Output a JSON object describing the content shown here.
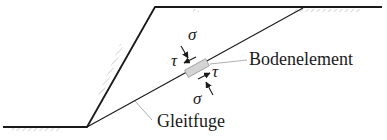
{
  "diagram": {
    "type": "slope-failure-sketch",
    "labels": {
      "element": "Bodenelement",
      "slip_surface": "Gleitfuge",
      "sigma_top": "σ",
      "tau_top": "τ",
      "tau_bottom": "τ",
      "sigma_bottom": "σ"
    },
    "colors": {
      "line": "#1a1a1a",
      "hatch": "#b0b0b0",
      "element_fill": "#d4d4d4",
      "leader": "#9a9a9a"
    }
  }
}
